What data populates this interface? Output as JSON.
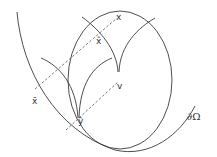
{
  "diagram": {
    "labels": {
      "x": "x",
      "x_hat": "x̂",
      "x_bar": "x̄",
      "v": "v",
      "y_hat": "ŷ",
      "boundary": "∂Ω"
    },
    "colors": {
      "stroke": "#3a3a3a",
      "dashed": "#555555",
      "background": "#ffffff"
    }
  }
}
